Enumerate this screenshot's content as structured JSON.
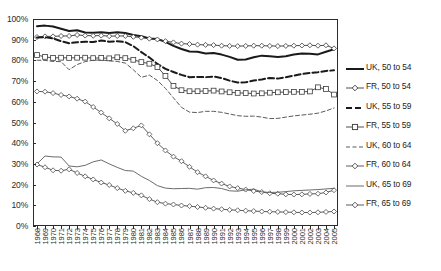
{
  "chart_data": {
    "type": "line",
    "title": "",
    "subtitle": "",
    "xlabel": "",
    "ylabel": "",
    "xlim": [
      1968,
      2005
    ],
    "ylim": [
      0,
      100
    ],
    "ytick_labels": [
      "0%",
      "10%",
      "20%",
      "30%",
      "40%",
      "50%",
      "60%",
      "70%",
      "80%",
      "90%",
      "100%"
    ],
    "ytick_values": [
      0,
      10,
      20,
      30,
      40,
      50,
      60,
      70,
      80,
      90,
      100
    ],
    "grid": false,
    "legend_position": "right",
    "x": [
      1968,
      1969,
      1970,
      1971,
      1972,
      1973,
      1974,
      1975,
      1976,
      1977,
      1978,
      1979,
      1980,
      1981,
      1982,
      1983,
      1984,
      1985,
      1986,
      1987,
      1988,
      1989,
      1990,
      1991,
      1992,
      1993,
      1994,
      1995,
      1996,
      1997,
      1998,
      1999,
      2000,
      2001,
      2002,
      2003,
      2004,
      2005
    ],
    "xtick_labels": [
      "1968",
      "1969",
      "1970",
      "1971",
      "1972",
      "1973",
      "1974",
      "1975",
      "1976",
      "1977",
      "1978",
      "1979",
      "1980",
      "1981",
      "1982",
      "1983",
      "1984",
      "1985",
      "1986",
      "1987",
      "1988",
      "1989",
      "1990",
      "1991",
      "1992",
      "1993",
      "1994",
      "1995",
      "1996",
      "1997",
      "1998",
      "1999",
      "2000",
      "2001",
      "2002",
      "2003",
      "2004",
      "2005"
    ],
    "series": [
      {
        "name": "UK, 50 to 54",
        "style": "solid-thick",
        "marker": "none",
        "color": "#1a1a1a",
        "values": [
          96.5,
          96.8,
          96.4,
          95.3,
          94.2,
          94.6,
          93.5,
          93.3,
          93.6,
          93.2,
          93.6,
          93.2,
          92.3,
          91.7,
          90.6,
          90.3,
          89.0,
          87.0,
          85.5,
          84.3,
          84.2,
          83.3,
          83.6,
          82.8,
          81.7,
          80.3,
          80.4,
          81.5,
          82.3,
          82.0,
          81.7,
          82.0,
          82.8,
          83.3,
          83.2,
          82.9,
          84.2,
          85.4
        ]
      },
      {
        "name": "FR, 50 to 54",
        "style": "solid-thin",
        "marker": "diamond",
        "color": "#3a3a3a",
        "values": [
          91.3,
          91.6,
          91.6,
          91.8,
          91.8,
          92.3,
          92.0,
          91.9,
          92.0,
          91.7,
          91.8,
          91.8,
          91.4,
          91.0,
          90.5,
          90.1,
          89.3,
          88.7,
          88.1,
          87.9,
          87.6,
          87.5,
          87.4,
          87.1,
          87.0,
          86.9,
          87.0,
          87.1,
          87.1,
          87.0,
          86.9,
          87.0,
          87.1,
          87.2,
          87.3,
          87.1,
          87.3,
          85.8
        ]
      },
      {
        "name": "UK, 55 to 59",
        "style": "dashed-thick",
        "marker": "none",
        "color": "#1a1a1a",
        "values": [
          91.1,
          91.2,
          90.6,
          89.3,
          88.3,
          88.8,
          89.0,
          88.9,
          89.6,
          89.0,
          89.3,
          88.8,
          86.9,
          84.0,
          81.4,
          78.3,
          75.9,
          74.4,
          73.0,
          71.9,
          72.0,
          71.9,
          72.2,
          71.5,
          70.2,
          69.3,
          69.4,
          70.3,
          70.8,
          71.5,
          71.2,
          71.9,
          72.6,
          73.4,
          73.9,
          74.3,
          74.9,
          75.2
        ]
      },
      {
        "name": "FR, 55 to 59",
        "style": "solid-thin",
        "marker": "square",
        "color": "#3a3a3a",
        "values": [
          82.6,
          81.7,
          81.2,
          81.3,
          81.2,
          81.3,
          81.3,
          81.1,
          81.2,
          81.0,
          81.5,
          81.1,
          80.3,
          79.2,
          78.4,
          76.8,
          72.5,
          67.7,
          65.6,
          65.1,
          65.1,
          65.2,
          65.4,
          65.0,
          64.6,
          64.3,
          64.2,
          64.0,
          64.1,
          64.4,
          64.6,
          64.7,
          64.8,
          64.8,
          65.0,
          67.0,
          66.2,
          63.5
        ]
      },
      {
        "name": "UK, 60 to 64",
        "style": "dashed-thin",
        "marker": "none",
        "color": "#5a5a5a",
        "values": [
          80.1,
          80.0,
          79.5,
          79.4,
          75.5,
          78.0,
          79.4,
          80.1,
          80.2,
          79.8,
          79.5,
          78.7,
          75.5,
          71.8,
          72.9,
          70.3,
          66.5,
          61.9,
          57.3,
          55.0,
          54.8,
          55.4,
          55.4,
          54.9,
          54.1,
          53.3,
          53.0,
          53.1,
          52.6,
          51.9,
          52.0,
          52.6,
          53.2,
          53.6,
          54.0,
          54.5,
          55.6,
          57.0
        ]
      },
      {
        "name": "FR, 60 to 64",
        "style": "solid-thin",
        "marker": "diamond",
        "color": "#4a4a4a",
        "values": [
          65.0,
          64.9,
          64.2,
          63.3,
          62.6,
          61.5,
          60.1,
          57.5,
          54.8,
          52.0,
          49.3,
          46.0,
          47.2,
          48.6,
          44.3,
          40.0,
          36.5,
          33.5,
          31.3,
          28.6,
          26.0,
          24.0,
          22.0,
          20.5,
          19.1,
          18.3,
          17.6,
          16.9,
          16.4,
          15.8,
          15.6,
          15.3,
          15.2,
          15.3,
          15.5,
          15.6,
          16.2,
          17.3
        ]
      },
      {
        "name": "UK, 65 to 69",
        "style": "solid-thin",
        "marker": "none",
        "color": "#5a5a5a",
        "values": [
          30.0,
          33.8,
          33.4,
          33.3,
          29.0,
          28.6,
          29.3,
          31.0,
          31.9,
          30.0,
          28.3,
          26.8,
          26.5,
          24.0,
          22.0,
          19.5,
          18.3,
          18.0,
          18.1,
          18.2,
          17.8,
          18.5,
          18.6,
          18.1,
          17.0,
          16.8,
          17.5,
          17.8,
          16.5,
          16.2,
          16.3,
          16.6,
          17.0,
          17.2,
          17.4,
          17.6,
          17.9,
          18.2
        ]
      },
      {
        "name": "FR, 65 to 69",
        "style": "solid-thin",
        "marker": "diamond",
        "color": "#4a4a4a",
        "values": [
          29.7,
          28.4,
          26.9,
          26.7,
          27.4,
          25.6,
          24.0,
          22.5,
          21.0,
          19.8,
          18.3,
          17.0,
          16.0,
          14.8,
          13.0,
          11.5,
          10.8,
          10.4,
          9.9,
          9.6,
          9.2,
          8.8,
          8.4,
          8.1,
          7.8,
          7.6,
          7.4,
          7.2,
          7.0,
          6.9,
          6.8,
          6.7,
          6.6,
          6.5,
          6.5,
          6.6,
          6.8,
          7.0
        ]
      }
    ]
  }
}
